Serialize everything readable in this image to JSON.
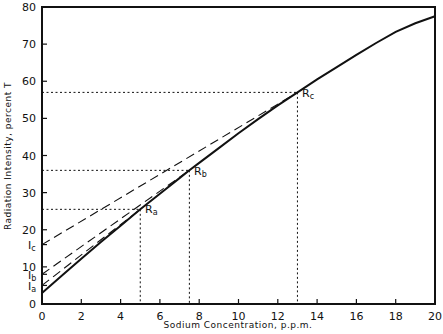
{
  "chart_data": {
    "type": "line",
    "title": "",
    "xlabel": "Sodium Concentration, p.p.m.",
    "ylabel": "Radiation Intensity, percent T",
    "xlim": [
      0,
      20
    ],
    "ylim": [
      0,
      80
    ],
    "x_ticks": [
      0,
      2,
      4,
      6,
      8,
      10,
      12,
      14,
      16,
      18,
      20
    ],
    "y_ticks": [
      0,
      10,
      20,
      30,
      40,
      50,
      60,
      70,
      80
    ],
    "y_tick_extra_labels": [
      {
        "label": "Ia",
        "value": 5
      },
      {
        "label": "Ib",
        "value": 8
      },
      {
        "label": "Ic",
        "value": 16
      }
    ],
    "grid": false,
    "legend": null,
    "series": [
      {
        "name": "Calibration curve",
        "style": "solid",
        "x": [
          0,
          1,
          2,
          3,
          4,
          5,
          6,
          7,
          7.5,
          8,
          9,
          10,
          11,
          12,
          13,
          14,
          15,
          16,
          17,
          18,
          19,
          20
        ],
        "y": [
          3,
          7.6,
          12.2,
          16.7,
          21.1,
          25.5,
          29.7,
          33.9,
          36,
          38,
          42,
          46,
          49.8,
          53.5,
          57,
          60.5,
          63.8,
          67.1,
          70.3,
          73.3,
          75.6,
          77.5
        ]
      },
      {
        "name": "Tangent through Ra",
        "style": "dashed",
        "x": [
          0,
          5
        ],
        "y": [
          5,
          25.5
        ]
      },
      {
        "name": "Tangent through Rb",
        "style": "dashed",
        "x": [
          0,
          7.5
        ],
        "y": [
          8,
          36
        ]
      },
      {
        "name": "Tangent through Rc",
        "style": "dashed",
        "x": [
          0,
          13
        ],
        "y": [
          16,
          57
        ]
      }
    ],
    "annotations": [
      {
        "label": "Ra",
        "x": 5,
        "y": 25.5
      },
      {
        "label": "Rb",
        "x": 7.5,
        "y": 36
      },
      {
        "label": "Rc",
        "x": 13,
        "y": 57
      }
    ],
    "reference_lines": [
      {
        "type": "dotted",
        "x": 5,
        "y": 25.5
      },
      {
        "type": "dotted",
        "x": 7.5,
        "y": 36
      },
      {
        "type": "dotted",
        "x": 13,
        "y": 57
      }
    ]
  },
  "labels": {
    "xlabel": "Sodium Concentration, p.p.m.",
    "ylabel": "Radiation Intensity, percent T",
    "x_ticks": [
      "0",
      "2",
      "4",
      "6",
      "8",
      "10",
      "12",
      "14",
      "16",
      "18",
      "20"
    ],
    "y_ticks": [
      "0",
      "10",
      "20",
      "30",
      "40",
      "50",
      "60",
      "70",
      "80"
    ],
    "ia": {
      "main": "I",
      "sub": "a"
    },
    "ib": {
      "main": "I",
      "sub": "b"
    },
    "ic": {
      "main": "I",
      "sub": "c"
    },
    "ra": {
      "main": "R",
      "sub": "a"
    },
    "rb": {
      "main": "R",
      "sub": "b"
    },
    "rc": {
      "main": "R",
      "sub": "c"
    }
  }
}
